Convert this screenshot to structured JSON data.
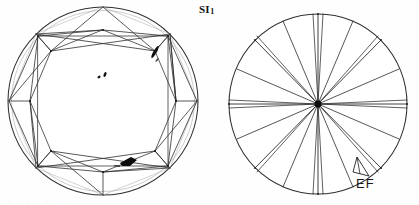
{
  "document": {
    "kind": "diamond-clarity-plot",
    "grade_label": "SI",
    "grade_subscript": "1",
    "background_color": "#fefefe",
    "ink_color": "#1a1a1a"
  },
  "crown_view": {
    "name": "crown-view",
    "center_x": 103,
    "center_y": 101,
    "radius_x": 95,
    "radius_y": 94,
    "table_label": "",
    "girdle_color": "#333333",
    "facet_color": "#2b2b2b",
    "inclusions": [
      {
        "id": "inclusion-upper-right-crystal",
        "type": "crystal",
        "x": 155,
        "y": 52,
        "length": 14,
        "width": 3.2,
        "angle": -60,
        "fill": "#101010"
      },
      {
        "id": "inclusion-center-pinpoint-a",
        "type": "pinpoint",
        "x": 99,
        "y": 77,
        "length": 3.4,
        "width": 2.4,
        "angle": -30,
        "fill": "#141414"
      },
      {
        "id": "inclusion-center-pinpoint-b",
        "type": "pinpoint",
        "x": 105,
        "y": 74,
        "length": 5.2,
        "width": 2.6,
        "angle": -65,
        "fill": "#141414"
      },
      {
        "id": "inclusion-lower-right-feather",
        "type": "feather",
        "x": 129,
        "y": 161,
        "length": 16,
        "width": 5,
        "angle": 18,
        "fill": "#0c0c0c"
      }
    ]
  },
  "pavilion_view": {
    "name": "pavilion-view",
    "center_x": 318,
    "center_y": 104,
    "radius_x": 89,
    "radius_y": 90,
    "culet_radius": 3.4,
    "culet_color": "#0d0d0d",
    "girdle_color": "#333333",
    "facet_color": "#2b2b2b",
    "markings": [
      {
        "id": "extra-facet-mark",
        "type": "extra-facet",
        "label": "EF",
        "label_x": 361,
        "label_y": 183
      }
    ]
  },
  "labels": {
    "grade": "SI",
    "grade_sub": "1",
    "extra_facet": "EF",
    "footer_fragment": ". . . . . . ."
  }
}
